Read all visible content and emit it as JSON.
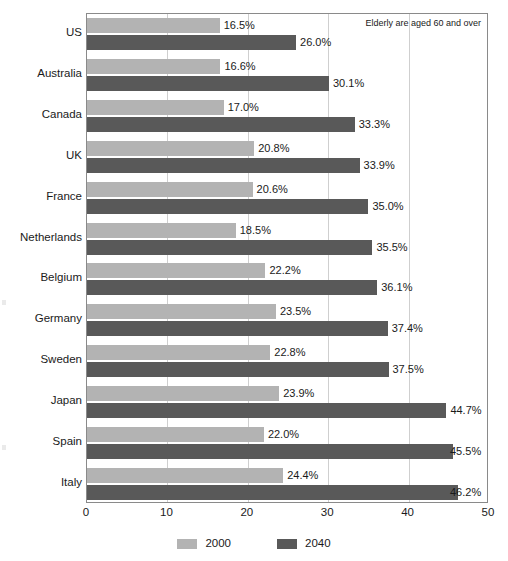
{
  "annotation": "Elderly are aged 60 and over",
  "legend": {
    "items": [
      {
        "label": "2000",
        "color": "#b3b3b3"
      },
      {
        "label": "2040",
        "color": "#595959"
      }
    ]
  },
  "axis": {
    "ticks": [
      "0",
      "10",
      "20",
      "30",
      "40",
      "50"
    ]
  },
  "chart_data": {
    "type": "bar",
    "orientation": "horizontal",
    "title": "",
    "subtitle": "",
    "xlabel": "",
    "ylabel": "",
    "xlim": [
      0,
      50
    ],
    "xticks": [
      0,
      10,
      20,
      30,
      40,
      50
    ],
    "grid": true,
    "grid_axis": "x",
    "legend_position": "bottom-center",
    "annotations": [
      "Elderly are aged 60 and over"
    ],
    "value_suffix": "%",
    "categories": [
      "US",
      "Australia",
      "Canada",
      "UK",
      "France",
      "Netherlands",
      "Belgium",
      "Germany",
      "Sweden",
      "Japan",
      "Spain",
      "Italy"
    ],
    "series": [
      {
        "name": "2000",
        "color": "#b3b3b3",
        "values": [
          16.5,
          16.6,
          17.0,
          20.8,
          20.6,
          18.5,
          22.2,
          23.5,
          22.8,
          23.9,
          22.0,
          24.4
        ],
        "labels": [
          "16.5%",
          "16.6%",
          "17.0%",
          "20.8%",
          "20.6%",
          "18.5%",
          "22.2%",
          "23.5%",
          "22.8%",
          "23.9%",
          "22.0%",
          "24.4%"
        ]
      },
      {
        "name": "2040",
        "color": "#595959",
        "values": [
          26.0,
          30.1,
          33.3,
          33.9,
          35.0,
          35.5,
          36.1,
          37.4,
          37.5,
          44.7,
          45.5,
          46.2
        ],
        "labels": [
          "26.0%",
          "30.1%",
          "33.3%",
          "33.9%",
          "35.0%",
          "35.5%",
          "36.1%",
          "37.4%",
          "37.5%",
          "44.7%",
          "45.5%",
          "46.2%"
        ]
      }
    ]
  }
}
